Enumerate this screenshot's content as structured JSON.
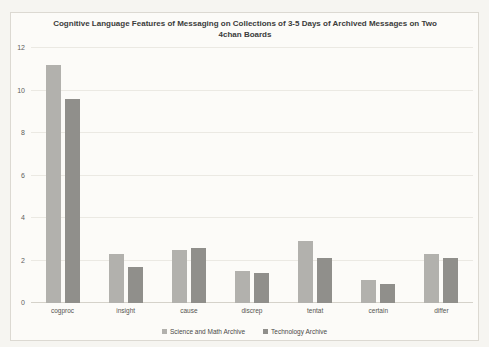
{
  "title": "Cognitive Language Features of Messaging on Collections of 3-5 Days of Archived Messages on Two 4chan Boards",
  "chart_data": {
    "type": "bar",
    "title": "Cognitive Language Features of Messaging on Collections of 3-5 Days of Archived Messages on Two 4chan Boards",
    "categories": [
      "cogproc",
      "insight",
      "cause",
      "discrep",
      "tentat",
      "certain",
      "differ"
    ],
    "series": [
      {
        "name": "Science and Math Archive",
        "color": "#b2b1ad",
        "values": [
          11.2,
          2.3,
          2.5,
          1.5,
          2.9,
          1.1,
          2.3
        ]
      },
      {
        "name": "Technology Archive",
        "color": "#908f8b",
        "values": [
          9.6,
          1.7,
          2.6,
          1.4,
          2.1,
          0.9,
          2.1
        ]
      }
    ],
    "xlabel": "",
    "ylabel": "",
    "ylim": [
      0,
      12
    ],
    "yticks": [
      0,
      2,
      4,
      6,
      8,
      10,
      12
    ],
    "grid": true,
    "legend_position": "bottom"
  }
}
